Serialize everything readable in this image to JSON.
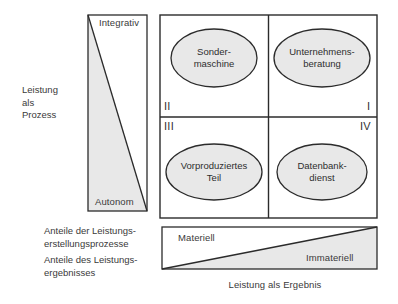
{
  "diagram": {
    "title_left": "Leistung\nals\nProzess",
    "title_bottom": "Leistung als Ergebnis",
    "vertical_bar": {
      "top_label": "Integrativ",
      "bottom_label": "Autonom"
    },
    "horizontal_bar": {
      "left_label": "Materiell",
      "right_label": "Immateriell"
    },
    "legend": {
      "line1": "Anteile der Leistungs-\nerstellungsprozesse",
      "line2": "Anteile des Leistungs-\nergebnisses"
    },
    "quadrants": [
      {
        "numeral": "II",
        "label": "Sonder-\nmaschine"
      },
      {
        "numeral": "I",
        "label": "Unternehmens-\nberatung"
      },
      {
        "numeral": "III",
        "label": "Vorproduziertes\nTeil"
      },
      {
        "numeral": "IV",
        "label": "Datenbank-\ndienst"
      }
    ],
    "colors": {
      "fill_gray": "#e8e8e8",
      "stroke_dark": "#2b2b2b",
      "text": "#333333",
      "background": "#ffffff"
    }
  }
}
